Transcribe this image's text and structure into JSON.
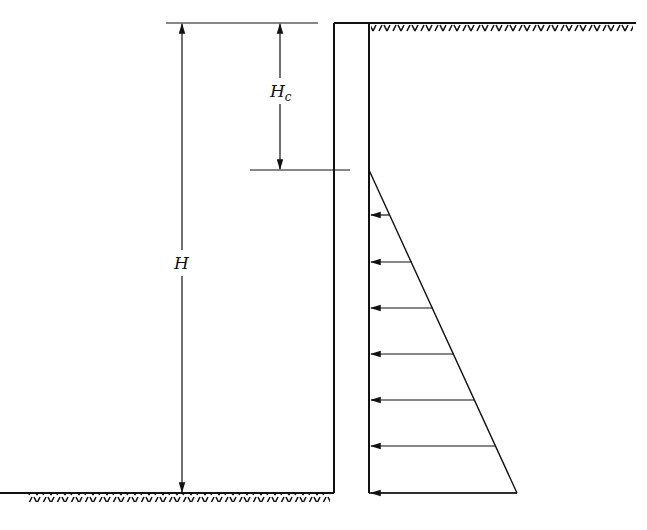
{
  "diagram": {
    "title": "",
    "labels": {
      "total_height": "H",
      "crack_depth_main": "H",
      "crack_depth_sub": "c"
    },
    "colors": {
      "line": "#111111",
      "background": "#ffffff"
    },
    "geometry": {
      "wall": {
        "x_left": 334,
        "x_right": 369,
        "top": 23,
        "bottom": 493
      },
      "ground_right_y": 23,
      "ground_left_y": 493,
      "crack_depth_y": 170,
      "pressure_triangle": {
        "apex": [
          369,
          170
        ],
        "base_end": [
          517,
          493
        ]
      },
      "arrow_levels_y": [
        215,
        262,
        308,
        354,
        400,
        446,
        493
      ]
    }
  }
}
